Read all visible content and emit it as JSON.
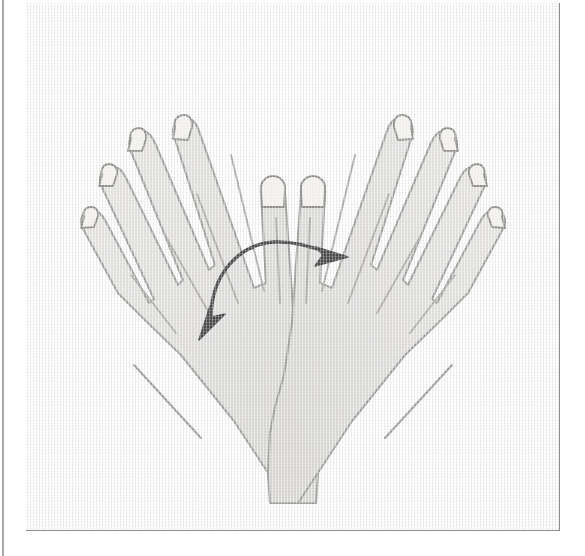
{
  "page": {
    "background_color": "#ffffff",
    "width": 585,
    "height": 556
  },
  "figure_panel": {
    "name": "hand-rotation-figure",
    "border_color": "#8d8d8d",
    "canvas_color": "#f6f6f5",
    "gutter_rule_color": "#9a9a9a"
  },
  "illustration": {
    "subject": "two-hands-crossed-at-wrists",
    "description": "Line drawing of two open hands crossed at the wrists, palms toward viewer, fingers spread and pointing upward and outward, forearms cut off at the bottom edge of the frame.",
    "style": "flat grayscale line art on textured canvas",
    "hand_fill_color": "#dcdbd9",
    "hand_outline_color": "#9a9a99",
    "crease_line_color": "#a8a7a5",
    "nail_outline_color": "#8f8e8c",
    "nail_fill_color": "#eeedeb",
    "arrow_color": "#4a4a4a",
    "elements": [
      {
        "name": "left-hand",
        "label": "Left hand",
        "finger_count": 5,
        "orientation": "fingers up and to the left, thumb up and to the right",
        "forearm_direction": "down and to the left"
      },
      {
        "name": "right-hand",
        "label": "Right hand",
        "finger_count": 5,
        "orientation": "fingers up and to the right, thumb up and to the left",
        "forearm_direction": "down and to the right"
      },
      {
        "name": "rotation-arrow",
        "label": "Double-headed curved rotation arrow",
        "arrow_type": "double-headed-curved",
        "head_count": 2,
        "head_directions": [
          "lower-left",
          "right"
        ],
        "placement": "over the wrist crossing point",
        "color": "#4a4a4a"
      }
    ]
  }
}
